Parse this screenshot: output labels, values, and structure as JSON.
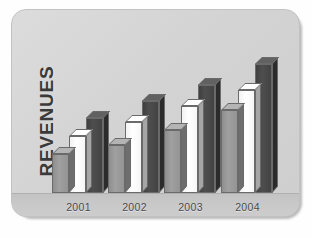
{
  "card": {
    "background_color": "#d4d4d4",
    "border_color": "#c2c2c2"
  },
  "chart_data": {
    "type": "bar",
    "title": "",
    "ylabel": "REVENUES",
    "xlabel": "",
    "categories": [
      "2001",
      "2002",
      "2003",
      "2004"
    ],
    "grid": false,
    "legend": "none",
    "ylim": [
      0,
      100
    ],
    "series": [
      {
        "name": "series-1",
        "color": "#949494",
        "values": [
          26,
          32,
          42,
          55
        ]
      },
      {
        "name": "series-2",
        "color": "#ffffff",
        "values": [
          38,
          47,
          58,
          69
        ]
      },
      {
        "name": "series-3",
        "color": "#434343",
        "values": [
          50,
          61,
          72,
          86
        ]
      }
    ]
  },
  "axis": {
    "y_title": "REVENUES",
    "x_ticks": [
      "2001",
      "2002",
      "2003",
      "2004"
    ]
  }
}
